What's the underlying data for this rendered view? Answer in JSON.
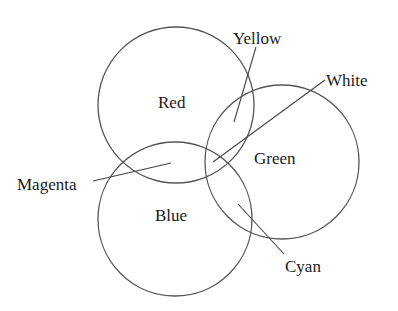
{
  "diagram": {
    "type": "venn",
    "circles": [
      {
        "id": "red",
        "label": "Red",
        "cx": 176,
        "cy": 105,
        "r": 78
      },
      {
        "id": "green",
        "label": "Green",
        "cx": 282,
        "cy": 162,
        "r": 77
      },
      {
        "id": "blue",
        "label": "Blue",
        "cx": 175,
        "cy": 219,
        "r": 77
      }
    ],
    "regions": [
      {
        "id": "yellow",
        "label": "Yellow",
        "overlap": [
          "red",
          "green"
        ]
      },
      {
        "id": "white",
        "label": "White",
        "overlap": [
          "red",
          "green",
          "blue"
        ]
      },
      {
        "id": "magenta",
        "label": "Magenta",
        "overlap": [
          "red",
          "blue"
        ]
      },
      {
        "id": "cyan",
        "label": "Cyan",
        "overlap": [
          "green",
          "blue"
        ]
      }
    ],
    "labels": {
      "red": "Red",
      "green": "Green",
      "blue": "Blue",
      "yellow": "Yellow",
      "white": "White",
      "magenta": "Magenta",
      "cyan": "Cyan"
    }
  }
}
